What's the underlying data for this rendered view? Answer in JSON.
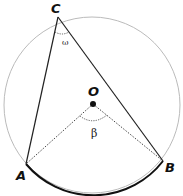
{
  "diagram": {
    "points": {
      "C": {
        "label": "C",
        "x": 58,
        "y": 17
      },
      "A": {
        "label": "A",
        "x": 26,
        "y": 164
      },
      "B": {
        "label": "B",
        "x": 163,
        "y": 161
      },
      "O": {
        "label": "O",
        "x": 93,
        "y": 104
      }
    },
    "angles": {
      "inscribed": {
        "label": "ω",
        "vertex": "C"
      },
      "central": {
        "label": "β",
        "vertex": "O"
      }
    },
    "circle": {
      "cx": 92,
      "cy": 105,
      "r": 88,
      "stroke": "#bbbbbb"
    },
    "arc_AB_stroke": "#111111"
  }
}
